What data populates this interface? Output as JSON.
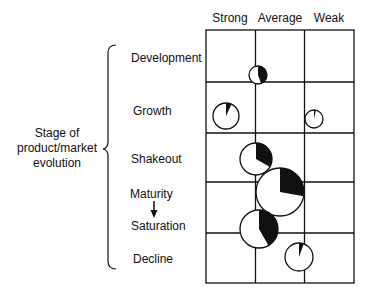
{
  "diagram": {
    "type": "matrix-pie-bubble",
    "axis_title": {
      "line1": "Stage of",
      "line2": "product/market",
      "line3": "evolution"
    },
    "columns": [
      "Strong",
      "Average",
      "Weak"
    ],
    "stages": [
      {
        "label": "Development"
      },
      {
        "label": "Growth"
      },
      {
        "label": "Shakeout"
      },
      {
        "label": "Maturity"
      },
      {
        "label": "Saturation"
      },
      {
        "label": "Decline"
      }
    ],
    "arrow": "maturity-to-saturation",
    "bubbles": [
      {
        "stage": "Development",
        "position": "Average",
        "cx": 258,
        "cy": 75,
        "r": 9,
        "wedge_deg": 160
      },
      {
        "stage": "Growth",
        "position": "Strong",
        "cx": 226,
        "cy": 116,
        "r": 13,
        "wedge_deg": 25
      },
      {
        "stage": "Growth",
        "position": "Weak",
        "cx": 314,
        "cy": 119,
        "r": 9,
        "wedge_deg": 12
      },
      {
        "stage": "Shakeout",
        "position": "Average",
        "cx": 256,
        "cy": 159,
        "r": 16,
        "wedge_deg": 120
      },
      {
        "stage": "Maturity",
        "position": "Average",
        "cx": 280,
        "cy": 192,
        "r": 24,
        "wedge_deg": 100
      },
      {
        "stage": "Saturation",
        "position": "Average",
        "cx": 259,
        "cy": 229,
        "r": 19,
        "wedge_deg": 150
      },
      {
        "stage": "Decline",
        "position": "Weak",
        "cx": 299,
        "cy": 257,
        "r": 14,
        "wedge_deg": 20
      }
    ],
    "colors": {
      "ink": "#111111",
      "fill": "#ffffff"
    }
  }
}
